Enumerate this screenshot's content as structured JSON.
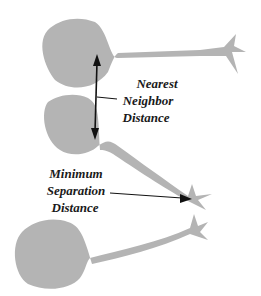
{
  "diagram": {
    "labels": {
      "nearest_neighbor": [
        "Nearest",
        "Neighbor",
        "Distance"
      ],
      "minimum_separation": [
        "Minimum",
        "Separation",
        "Distance"
      ]
    },
    "colors": {
      "cell_fill": "#b4b4b4",
      "arrow": "#111111",
      "background": "#ffffff"
    },
    "cells": [
      {
        "name": "top-neuron"
      },
      {
        "name": "middle-neuron"
      },
      {
        "name": "bottom-neuron"
      }
    ]
  }
}
